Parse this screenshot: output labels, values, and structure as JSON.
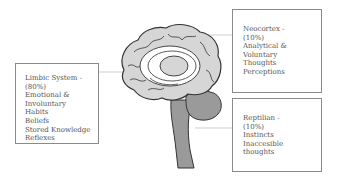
{
  "diagram": {
    "boxes": {
      "limbic": {
        "lines": [
          "Limbic System -",
          "(80%)",
          "Emotional &",
          "Involuntary",
          "Habits",
          "Beliefs",
          "Stored Knowledge",
          "Reflexes"
        ]
      },
      "neocortex": {
        "lines": [
          "Neocortex -",
          "(10%)",
          "Analytical &",
          "Voluntary",
          "Thoughts",
          "Perceptions"
        ]
      },
      "reptilian": {
        "lines": [
          "Reptilian -",
          "(10%)",
          "Instincts",
          "Inaccesible",
          "thoughts"
        ]
      }
    },
    "colors": {
      "brain_fill": "#d6d6d6",
      "brain_outline": "#333333",
      "stem_fill": "#9a9a9a",
      "box_border": "#8a8a8a",
      "text": "#555555"
    }
  }
}
